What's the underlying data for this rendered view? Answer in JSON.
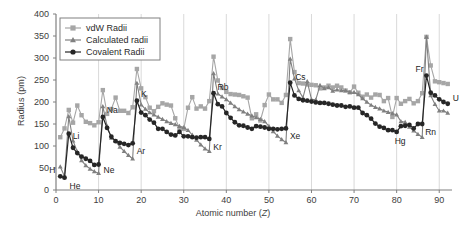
{
  "chart_data": {
    "type": "line",
    "title": "",
    "xlabel": "Atomic number (Z)",
    "ylabel": "Radius (pm)",
    "xlim": [
      0,
      93
    ],
    "ylim": [
      0,
      400
    ],
    "xticks": [
      0,
      10,
      20,
      30,
      40,
      50,
      60,
      70,
      80,
      90
    ],
    "yticks": [
      0,
      50,
      100,
      150,
      200,
      250,
      300,
      350,
      400
    ],
    "grid": "vertical-only",
    "legend_position": "top-left",
    "legend": [
      "vdW Radii",
      "Calculated radii",
      "Covalent Radii"
    ],
    "colors": {
      "vdw": "#a6a6a6",
      "calculated": "#808080",
      "covalent": "#262626",
      "axis": "#808080",
      "grid": "#d9d9d9",
      "text": "#3d3d3d"
    },
    "markers": {
      "vdw": "square",
      "calculated": "triangle",
      "covalent": "circle"
    },
    "x": [
      1,
      2,
      3,
      4,
      5,
      6,
      7,
      8,
      9,
      10,
      11,
      12,
      13,
      14,
      15,
      16,
      17,
      18,
      19,
      20,
      21,
      22,
      23,
      24,
      25,
      26,
      27,
      28,
      29,
      30,
      31,
      32,
      33,
      34,
      35,
      36,
      37,
      38,
      39,
      40,
      41,
      42,
      43,
      44,
      45,
      46,
      47,
      48,
      49,
      50,
      51,
      52,
      53,
      54,
      55,
      56,
      57,
      58,
      59,
      60,
      61,
      62,
      63,
      64,
      65,
      66,
      67,
      68,
      69,
      70,
      71,
      72,
      73,
      74,
      75,
      76,
      77,
      78,
      79,
      80,
      81,
      82,
      83,
      84,
      85,
      86,
      87,
      88,
      89,
      90,
      91,
      92
    ],
    "series": [
      {
        "name": "vdW Radii",
        "values": [
          120,
          140,
          182,
          153,
          192,
          170,
          155,
          152,
          147,
          154,
          227,
          173,
          184,
          210,
          180,
          180,
          175,
          188,
          275,
          231,
          211,
          187,
          179,
          189,
          197,
          194,
          192,
          163,
          140,
          139,
          187,
          211,
          185,
          190,
          185,
          202,
          303,
          249,
          232,
          223,
          218,
          217,
          216,
          213,
          210,
          163,
          172,
          158,
          193,
          217,
          206,
          206,
          198,
          216,
          343,
          268,
          243,
          242,
          240,
          239,
          238,
          231,
          233,
          237,
          233,
          237,
          233,
          226,
          222,
          235,
          221,
          212,
          217,
          210,
          217,
          216,
          202,
          209,
          166,
          209,
          196,
          202,
          207,
          197,
          202,
          220,
          348,
          283,
          247,
          245,
          243,
          241
        ]
      },
      {
        "name": "Calculated radii",
        "values": [
          53,
          31,
          167,
          112,
          87,
          67,
          56,
          48,
          42,
          38,
          190,
          145,
          118,
          111,
          98,
          88,
          79,
          71,
          243,
          194,
          184,
          176,
          171,
          166,
          161,
          156,
          152,
          149,
          145,
          142,
          136,
          125,
          114,
          103,
          94,
          88,
          265,
          219,
          212,
          206,
          198,
          190,
          183,
          178,
          173,
          169,
          165,
          161,
          156,
          145,
          133,
          123,
          115,
          108,
          298,
          253,
          226,
          210,
          247,
          206,
          205,
          238,
          231,
          233,
          225,
          228,
          226,
          226,
          222,
          222,
          217,
          208,
          200,
          193,
          188,
          185,
          180,
          177,
          174,
          171,
          156,
          154,
          143,
          135,
          127,
          120,
          348,
          215,
          195,
          180,
          180,
          175
        ]
      },
      {
        "name": "Covalent Radii",
        "values": [
          31,
          28,
          128,
          96,
          84,
          76,
          71,
          66,
          57,
          58,
          166,
          141,
          121,
          111,
          107,
          105,
          102,
          106,
          203,
          176,
          170,
          160,
          153,
          139,
          139,
          132,
          126,
          124,
          132,
          122,
          122,
          120,
          119,
          120,
          120,
          116,
          220,
          195,
          190,
          175,
          164,
          154,
          147,
          146,
          142,
          139,
          145,
          144,
          142,
          139,
          139,
          138,
          139,
          140,
          244,
          215,
          207,
          204,
          203,
          201,
          199,
          198,
          198,
          196,
          194,
          192,
          192,
          189,
          190,
          187,
          187,
          175,
          170,
          162,
          151,
          144,
          141,
          136,
          136,
          132,
          145,
          146,
          148,
          140,
          150,
          150,
          260,
          221,
          215,
          206,
          200,
          196
        ]
      }
    ],
    "annotations": [
      {
        "label": "H",
        "x": 1,
        "y": 31,
        "dx": -11,
        "dy": -3
      },
      {
        "label": "He",
        "x": 2,
        "y": 28,
        "dx": 5,
        "dy": 11
      },
      {
        "label": "Li",
        "x": 3,
        "y": 128,
        "dx": 4,
        "dy": 5
      },
      {
        "label": "Ne",
        "x": 10,
        "y": 58,
        "dx": 5,
        "dy": 9
      },
      {
        "label": "Na",
        "x": 11,
        "y": 166,
        "dx": 4,
        "dy": -4
      },
      {
        "label": "Ar",
        "x": 18,
        "y": 106,
        "dx": 4,
        "dy": 11
      },
      {
        "label": "K",
        "x": 19,
        "y": 203,
        "dx": 4,
        "dy": -4
      },
      {
        "label": "Kr",
        "x": 36,
        "y": 116,
        "dx": 4,
        "dy": 11
      },
      {
        "label": "Rb",
        "x": 37,
        "y": 220,
        "dx": 4,
        "dy": -3
      },
      {
        "label": "Xe",
        "x": 54,
        "y": 140,
        "dx": 4,
        "dy": 11
      },
      {
        "label": "Cs",
        "x": 55,
        "y": 244,
        "dx": 5,
        "dy": -3
      },
      {
        "label": "Hg",
        "x": 80,
        "y": 132,
        "dx": -2,
        "dy": 12
      },
      {
        "label": "Rn",
        "x": 86,
        "y": 150,
        "dx": 3,
        "dy": 11
      },
      {
        "label": "Fr",
        "x": 87,
        "y": 260,
        "dx": -11,
        "dy": -4
      },
      {
        "label": "U",
        "x": 92,
        "y": 196,
        "dx": 5,
        "dy": -3
      }
    ]
  }
}
